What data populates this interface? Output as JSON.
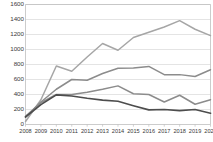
{
  "chart_data": {
    "type": "line",
    "title": "",
    "subtitle": "",
    "xlabel": "",
    "ylabel": "",
    "grid": true,
    "legend": "none",
    "xlim": [
      2008,
      2020
    ],
    "ylim": [
      0,
      1600
    ],
    "ytick_step": 200,
    "categories": [
      2008,
      2009,
      2010,
      2011,
      2012,
      2013,
      2014,
      2015,
      2016,
      2017,
      2018,
      2019,
      2020
    ],
    "xtick_labels": [
      "2008",
      "2009",
      "2010",
      "2011",
      "2012",
      "2013",
      "2014",
      "2015",
      "2016",
      "2017",
      "2018",
      "2019",
      "2020"
    ],
    "ytick_labels": [
      "0",
      "200",
      "400",
      "600",
      "800",
      "1000",
      "1200",
      "1400",
      "1600"
    ],
    "ytick_values": [
      0,
      200,
      400,
      600,
      800,
      1000,
      1200,
      1400,
      1600
    ],
    "series": [
      {
        "name": "series-1",
        "color": "#a6a6a6",
        "width": 1.5,
        "values": [
          40,
          330,
          780,
          710,
          900,
          1080,
          990,
          1160,
          1230,
          1300,
          1385,
          1270,
          1185
        ]
      },
      {
        "name": "series-2",
        "color": "#8c8c8c",
        "width": 1.5,
        "values": [
          100,
          300,
          470,
          600,
          590,
          680,
          750,
          755,
          775,
          665,
          665,
          640,
          730
        ]
      },
      {
        "name": "series-3",
        "color": "#8c8c8c",
        "width": 1.5,
        "values": [
          110,
          290,
          400,
          400,
          430,
          470,
          515,
          410,
          400,
          300,
          390,
          270,
          330
        ]
      },
      {
        "name": "series-4",
        "color": "#4d4d4d",
        "width": 1.7,
        "values": [
          100,
          265,
          395,
          380,
          350,
          325,
          310,
          250,
          195,
          200,
          185,
          200,
          150
        ]
      }
    ]
  },
  "style": {
    "background": "#ffffff",
    "grid_color": "#d9d9d9",
    "axis_color": "#bfbfbf",
    "tick_text_color": "#3a3a3a"
  }
}
